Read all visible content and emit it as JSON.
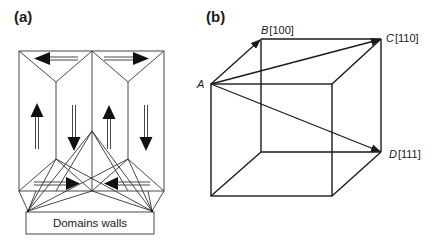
{
  "figure": {
    "panel_a": {
      "label": "(a)",
      "caption_box": "Domains walls",
      "domains": [
        {
          "position": "top-left",
          "magnetization": "left"
        },
        {
          "position": "top-right",
          "magnetization": "right"
        },
        {
          "position": "column-1",
          "magnetization": "up"
        },
        {
          "position": "column-2",
          "magnetization": "down"
        },
        {
          "position": "column-3",
          "magnetization": "up"
        },
        {
          "position": "column-4",
          "magnetization": "down"
        },
        {
          "position": "bottom-left",
          "magnetization": "right"
        },
        {
          "position": "bottom-right",
          "magnetization": "left"
        }
      ]
    },
    "panel_b": {
      "label": "(b)",
      "vertices": {
        "A": {
          "letter": "A",
          "index": ""
        },
        "B": {
          "letter": "B",
          "index": "[100]"
        },
        "C": {
          "letter": "C",
          "index": "[110]"
        },
        "D": {
          "letter": "D",
          "index": "[111]"
        }
      },
      "vectors": [
        "A→B",
        "A→C",
        "A→D"
      ]
    },
    "colors": {
      "line": "#1a1a1a",
      "background": "#ffffff"
    }
  }
}
